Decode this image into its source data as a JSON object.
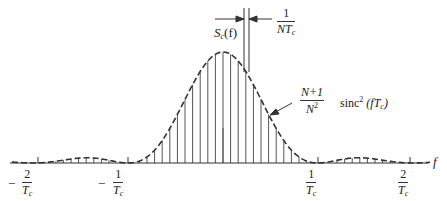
{
  "diagram": {
    "type": "power spectral density of spread-spectrum code (line spectrum)",
    "axis": {
      "variable_label": "f"
    },
    "ticks": [
      {
        "sign": "−",
        "num": "2",
        "den": "T",
        "den_sub": "c",
        "x": 38
      },
      {
        "sign": "−",
        "num": "1",
        "den": "T",
        "den_sub": "c",
        "x": 128
      },
      {
        "sign": "",
        "num": "1",
        "den": "T",
        "den_sub": "c",
        "x": 318
      },
      {
        "sign": "",
        "num": "2",
        "den": "T",
        "den_sub": "c",
        "x": 410
      }
    ],
    "spectrum_label": {
      "main": "S",
      "sub": "c",
      "arg": "(f)"
    },
    "spacing_label": {
      "num": "1",
      "den": "NT",
      "den_sub": "c"
    },
    "envelope_label": {
      "coef_num": "N+1",
      "coef_den": "N",
      "coef_den_sup": "2",
      "func": "sinc",
      "func_sup": "2",
      "arg": "(fT",
      "arg_sub": "c",
      "arg_close": ")"
    },
    "colors": {
      "ink": "#333333",
      "background": "#ffffff"
    }
  }
}
